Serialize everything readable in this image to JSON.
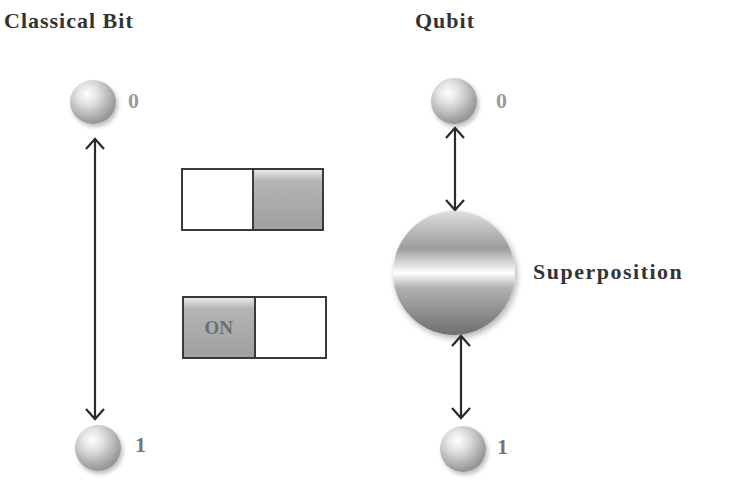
{
  "classical": {
    "title": "Classical Bit",
    "state_zero": "0",
    "state_one": "1",
    "switch_off": {
      "label": "OFF",
      "state": "off"
    },
    "switch_on": {
      "label": "ON",
      "state": "on"
    }
  },
  "qubit": {
    "title": "Qubit",
    "state_zero": "0",
    "state_one": "1",
    "superposition_label": "Superposition"
  },
  "colors": {
    "text": "#333333",
    "label_gray": "#9a9a9a",
    "arrow": "#2a2a2a",
    "switch_fill": "#a5a5a5"
  }
}
